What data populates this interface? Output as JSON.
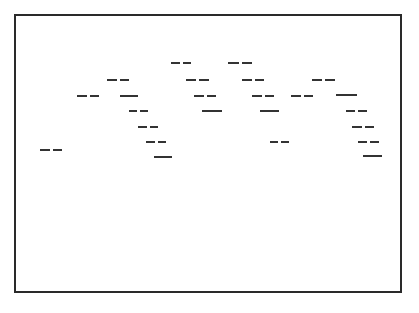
{
  "diagram": {
    "frame": {
      "x": 14,
      "y": 14,
      "width": 386,
      "height": 277,
      "stroke": "#2a2a2a"
    },
    "line_color": "#333333",
    "segments": [
      {
        "x1": 40,
        "x2": 62,
        "y": 150,
        "style": "dashed"
      },
      {
        "x1": 77,
        "x2": 99,
        "y": 96,
        "style": "dashed"
      },
      {
        "x1": 107,
        "x2": 129,
        "y": 80,
        "style": "dashed"
      },
      {
        "x1": 120,
        "x2": 138,
        "y": 96,
        "style": "solid"
      },
      {
        "x1": 129,
        "x2": 148,
        "y": 111,
        "style": "dashed"
      },
      {
        "x1": 138,
        "x2": 158,
        "y": 127,
        "style": "dashed"
      },
      {
        "x1": 146,
        "x2": 166,
        "y": 142,
        "style": "dashed"
      },
      {
        "x1": 154,
        "x2": 172,
        "y": 157,
        "style": "solid"
      },
      {
        "x1": 171,
        "x2": 191,
        "y": 63,
        "style": "dashed"
      },
      {
        "x1": 186,
        "x2": 209,
        "y": 80,
        "style": "dashed"
      },
      {
        "x1": 194,
        "x2": 216,
        "y": 96,
        "style": "dashed"
      },
      {
        "x1": 202,
        "x2": 222,
        "y": 111,
        "style": "solid"
      },
      {
        "x1": 228,
        "x2": 252,
        "y": 63,
        "style": "dashed"
      },
      {
        "x1": 242,
        "x2": 264,
        "y": 80,
        "style": "dashed"
      },
      {
        "x1": 252,
        "x2": 274,
        "y": 96,
        "style": "dashed"
      },
      {
        "x1": 260,
        "x2": 279,
        "y": 111,
        "style": "solid"
      },
      {
        "x1": 270,
        "x2": 289,
        "y": 142,
        "style": "dashed"
      },
      {
        "x1": 291,
        "x2": 313,
        "y": 96,
        "style": "dashed"
      },
      {
        "x1": 312,
        "x2": 335,
        "y": 80,
        "style": "dashed"
      },
      {
        "x1": 336,
        "x2": 357,
        "y": 95,
        "style": "solid"
      },
      {
        "x1": 346,
        "x2": 367,
        "y": 111,
        "style": "dashed"
      },
      {
        "x1": 352,
        "x2": 374,
        "y": 127,
        "style": "dashed"
      },
      {
        "x1": 358,
        "x2": 379,
        "y": 142,
        "style": "dashed"
      },
      {
        "x1": 363,
        "x2": 382,
        "y": 156,
        "style": "solid"
      }
    ]
  }
}
